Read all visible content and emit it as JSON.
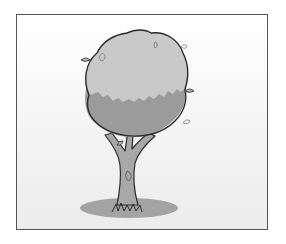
{
  "illustration": {
    "subject": "tree",
    "style": "grayscale clip-art",
    "colors": {
      "frame_border": "#555555",
      "background_top": "#ffffff",
      "background_bottom": "#ececec",
      "crown_light": "#c9c9c9",
      "crown_shade": "#9b9b9b",
      "outline": "#2b2b2b",
      "trunk": "#a8a8a8",
      "shadow": "#a3a3a3"
    }
  }
}
